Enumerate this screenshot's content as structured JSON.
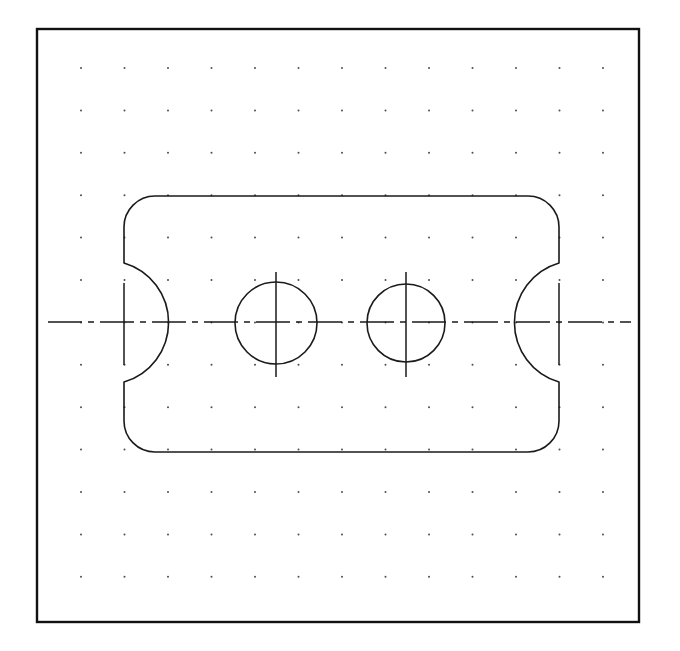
{
  "document": {
    "title": "Engineering Part Drawing",
    "view_name": "orthographic-top-view",
    "drawing_type": "mechanical-part-outline",
    "background_color": "#ffffff",
    "line_color": "#1a1a1a",
    "grid_dot_color": "#555555"
  },
  "canvas": {
    "width": 680,
    "height": 651
  },
  "border": {
    "name": "drawing-frame",
    "x": 37,
    "y": 29,
    "width": 602,
    "height": 593,
    "stroke_width": 2.4,
    "color": "#111111"
  },
  "grid": {
    "name": "construction-dot-grid",
    "origin_x": 81,
    "origin_y": 68,
    "spacing_x": 43.5,
    "spacing_y": 42.4,
    "columns": 13,
    "rows": 13,
    "dot_radius": 1.0,
    "color": "#4d4d4d"
  },
  "part": {
    "name": "slotted-plate",
    "outline": {
      "left_edge_x": 124,
      "right_edge_x": 559,
      "top_edge_y": 196,
      "bottom_edge_y": 452,
      "corner_radius": 31,
      "stroke_width": 1.6
    },
    "notches": [
      {
        "name": "left-side-notch",
        "center_x": 124,
        "center_y": 322,
        "radius": 62,
        "bulge_direction": "right",
        "top_y": 263,
        "bottom_y": 382
      },
      {
        "name": "right-side-notch",
        "center_x": 559,
        "center_y": 322,
        "radius": 62,
        "bulge_direction": "left",
        "top_y": 263,
        "bottom_y": 382
      }
    ],
    "holes": [
      {
        "name": "left-bore-hole",
        "center_x": 276,
        "center_y": 323,
        "radius": 41
      },
      {
        "name": "right-bore-hole",
        "center_x": 406,
        "center_y": 323,
        "radius": 39
      }
    ]
  },
  "centerlines": {
    "horizontal": {
      "name": "main-horizontal-centerline",
      "y": 322,
      "x_start": 48,
      "x_end": 631,
      "dash_pattern": "34 6 6 6",
      "stroke_width": 1.5
    },
    "vertical_marks": [
      {
        "name": "left-notch-vertical-centerline",
        "x": 124,
        "y_start": 283,
        "y_end": 365,
        "style": "solid"
      },
      {
        "name": "left-hole-vertical-centerline",
        "x": 276,
        "y_start": 272,
        "y_end": 377,
        "style": "solid"
      },
      {
        "name": "right-hole-vertical-centerline",
        "x": 406,
        "y_start": 272,
        "y_end": 377,
        "style": "solid"
      },
      {
        "name": "right-notch-vertical-centerline",
        "x": 559,
        "y_start": 283,
        "y_end": 365,
        "style": "solid"
      }
    ]
  }
}
